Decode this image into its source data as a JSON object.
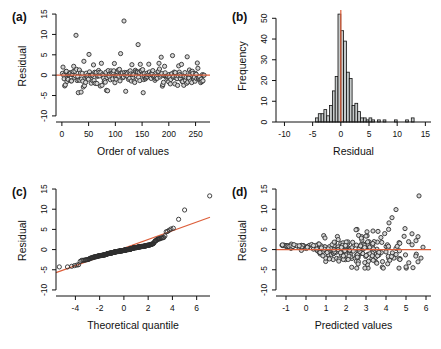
{
  "figure": {
    "background": "#ffffff",
    "accent_line_color": "#dd5f3b",
    "point_fill": "#d6d6d6",
    "point_stroke": "#2f2f2f",
    "bar_fill": "#c6caca",
    "bar_stroke": "#111111",
    "axis_color": "#111111"
  },
  "chart_data": {
    "shared_residual_sample": {
      "n": 252,
      "seed": 11,
      "mix_p": 0.62,
      "sd_core": 0.9,
      "sd_tail": 2.0,
      "mean": -0.15,
      "clip": [
        -4.3,
        5.2
      ],
      "outliers": [
        [
          24,
          9.8
        ],
        [
          47,
          5.1
        ],
        [
          103,
          5.3
        ],
        [
          109,
          13.3
        ],
        [
          134,
          7.5
        ],
        [
          175,
          4.4
        ],
        [
          195,
          4.8
        ],
        [
          221,
          4.5
        ]
      ]
    },
    "panels": [
      {
        "id": "a",
        "type": "scatter",
        "render": "order",
        "panel_label": "(a)",
        "xlabel": "Order of values",
        "ylabel": "Residual",
        "xlim": [
          -11,
          277
        ],
        "ylim": [
          -11.5,
          16
        ],
        "xticks": [
          0,
          50,
          100,
          150,
          200,
          250
        ],
        "yticks": [
          -10,
          -5,
          0,
          5,
          10,
          15
        ],
        "x_max": 266,
        "refline": {
          "type": "h",
          "at": 0
        },
        "notable_points": [
          [
            26,
            9.8
          ],
          [
            110,
            13.3
          ],
          [
            135,
            7.5
          ]
        ]
      },
      {
        "id": "b",
        "type": "bar",
        "render": "histogram",
        "panel_label": "(b)",
        "xlabel": "Residual",
        "ylabel": "Frequency",
        "xlim": [
          -11.5,
          16
        ],
        "ylim": [
          0,
          54
        ],
        "xticks": [
          -10,
          -5,
          0,
          5,
          10,
          15
        ],
        "yticks": [
          0,
          10,
          20,
          30,
          40,
          50
        ],
        "refline": {
          "type": "v",
          "at": 0
        },
        "bins": {
          "start": -4.5,
          "width": 0.5,
          "counts": [
            2,
            4,
            4,
            6,
            3,
            8,
            15,
            22,
            52,
            44,
            39,
            24,
            21,
            8,
            9,
            5,
            2,
            2,
            1,
            2,
            1,
            0,
            1,
            0,
            1,
            0,
            0,
            0,
            1,
            0,
            0,
            0,
            1,
            0,
            2,
            0
          ]
        }
      },
      {
        "id": "c",
        "type": "scatter",
        "render": "qq",
        "panel_label": "(c)",
        "xlabel": "Theoretical quantile",
        "ylabel": "Residual",
        "xlim": [
          -5.6,
          7.1
        ],
        "ylim": [
          -11.5,
          16
        ],
        "xticks": [
          -4,
          -2,
          0,
          2,
          4,
          6
        ],
        "yticks": [
          -10,
          -5,
          0,
          5,
          10,
          15
        ],
        "refline": {
          "type": "ab",
          "intercept": 0.33,
          "slope": 1.08
        },
        "qq": {
          "quantile_scale": 1.85,
          "top_x_stretch": [
            1.75,
            0.35,
            0.2
          ]
        },
        "notable_points": [
          [
            6.9,
            13.3
          ],
          [
            5.1,
            9.8
          ],
          [
            4.7,
            7.5
          ]
        ]
      },
      {
        "id": "d",
        "type": "scatter",
        "render": "funnel",
        "panel_label": "(d)",
        "xlabel": "Predicted values",
        "ylabel": "Residual",
        "xlim": [
          -1.5,
          6.25
        ],
        "ylim": [
          -11.5,
          16
        ],
        "xticks": [
          -1,
          0,
          1,
          2,
          3,
          4,
          5,
          6
        ],
        "yticks": [
          -10,
          -5,
          0,
          5,
          10,
          15
        ],
        "refline": {
          "type": "h",
          "at": 0
        },
        "funnel": {
          "n": 250,
          "seed": 23,
          "x_min": -1.2,
          "x_max": 5.9,
          "mean_a": 0.9,
          "mean_b": -0.33,
          "sd_a": 0.15,
          "sd_b": 0.42,
          "clip": [
            -4.6,
            5.0
          ]
        },
        "points_extra": [
          [
            5.65,
            13.3
          ],
          [
            4.5,
            9.9
          ],
          [
            4.3,
            7.9
          ],
          [
            4.15,
            6.6
          ],
          [
            2.55,
            5.0
          ],
          [
            3.35,
            4.6
          ],
          [
            4.95,
            5.2
          ],
          [
            2.5,
            4.9
          ],
          [
            3.05,
            4.4
          ],
          [
            3.6,
            4.5
          ],
          [
            5.35,
            -4.5
          ],
          [
            4.65,
            -4.6
          ],
          [
            5.0,
            -4.3
          ],
          [
            5.75,
            -2.1
          ],
          [
            5.5,
            2.2
          ],
          [
            5.85,
            0.6
          ],
          [
            5.6,
            3.2
          ],
          [
            5.3,
            3.9
          ],
          [
            -1.2,
            1.05
          ],
          [
            -1.15,
            0.95
          ],
          [
            -1.1,
            1.1
          ],
          [
            -1.05,
            0.9
          ],
          [
            -1.0,
            1.0
          ],
          [
            -0.95,
            0.85
          ],
          [
            -0.9,
            0.95
          ],
          [
            -0.85,
            0.8
          ],
          [
            -1.18,
            1.15
          ],
          [
            -0.75,
            0.9
          ],
          [
            -0.65,
            0.75
          ],
          [
            -0.6,
            1.2
          ]
        ]
      }
    ]
  }
}
